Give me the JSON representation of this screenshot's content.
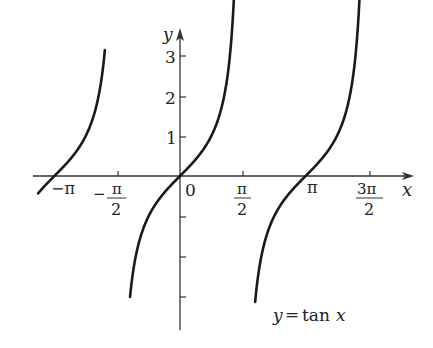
{
  "chart_data": {
    "type": "line",
    "title": "",
    "function": "tan x",
    "annotation": "y = tan x",
    "xlabel": "x",
    "ylabel": "y",
    "x_tick_labels": [
      "−π",
      "−π/2",
      "0",
      "π/2",
      "π",
      "3π/2"
    ],
    "x_tick_values": [
      -3.1416,
      -1.5708,
      0,
      1.5708,
      3.1416,
      4.7124
    ],
    "y_tick_labels": [
      "1",
      "2",
      "3"
    ],
    "y_tick_values": [
      1,
      2,
      3,
      -1,
      -2,
      -3
    ],
    "xlim": [
      -4.1,
      6.0
    ],
    "ylim": [
      -4.0,
      3.5
    ],
    "grid": false,
    "branches": [
      {
        "x_from": -3.55,
        "x_to": -1.88,
        "note": "branch through (−π, 0)"
      },
      {
        "x_from": -1.25,
        "x_to": 1.37,
        "note": "branch through (0, 0)"
      },
      {
        "x_from": 1.88,
        "x_to": 4.49,
        "note": "branch through (π, 0)"
      }
    ],
    "sample_points": [
      {
        "x": -3.1416,
        "y": 0
      },
      {
        "x": 0,
        "y": 0
      },
      {
        "x": 0.7854,
        "y": 1
      },
      {
        "x": 1.1071,
        "y": 2
      },
      {
        "x": 1.249,
        "y": 3
      },
      {
        "x": -0.7854,
        "y": -1
      },
      {
        "x": 3.1416,
        "y": 0
      }
    ]
  },
  "labels": {
    "x_axis": "x",
    "y_axis": "y",
    "origin": "0",
    "neg_pi": "−π",
    "neg_pi_half_num": "π",
    "neg_pi_half_den": "2",
    "neg_sign": "−",
    "pi_half_num": "π",
    "pi_half_den": "2",
    "pi": "π",
    "three_pi_half_num": "3π",
    "three_pi_half_den": "2",
    "y1": "1",
    "y2": "2",
    "y3": "3",
    "annotation_y": "y",
    "annotation_eq": "=",
    "annotation_tan": "tan",
    "annotation_x": "x"
  }
}
